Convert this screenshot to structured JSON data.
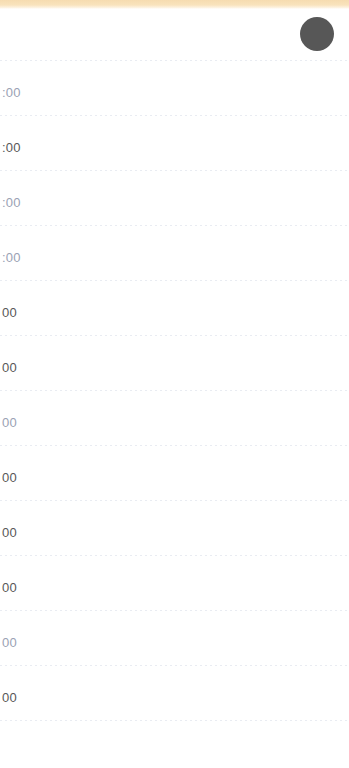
{
  "window": {
    "width": 349,
    "height": 768
  },
  "theme": {
    "accent_bar_color": "#f6dcb0",
    "avatar_color": "#575757",
    "grid_line_color": "#e9ecf2",
    "label_color": "#585858",
    "faded_label_color": "#9aa2b4",
    "background_color": "#ffffff"
  },
  "header": {
    "accent_bar": "",
    "avatar_label": ""
  },
  "schedule": {
    "rows": [
      {
        "label": "",
        "faded": false,
        "top": 6,
        "line_y": 61
      },
      {
        "label": ":00",
        "faded": true,
        "top": 61,
        "line_y": 116
      },
      {
        "label": ":00",
        "faded": false,
        "top": 116,
        "line_y": 171
      },
      {
        "label": ":00",
        "faded": true,
        "top": 171,
        "line_y": 226
      },
      {
        "label": ":00",
        "faded": true,
        "top": 226,
        "line_y": 281
      },
      {
        "label": "00",
        "faded": false,
        "top": 281,
        "line_y": 336
      },
      {
        "label": "00",
        "faded": false,
        "top": 336,
        "line_y": 391
      },
      {
        "label": "00",
        "faded": true,
        "top": 391,
        "line_y": 446
      },
      {
        "label": "00",
        "faded": false,
        "top": 446,
        "line_y": 501
      },
      {
        "label": "00",
        "faded": false,
        "top": 501,
        "line_y": 556
      },
      {
        "label": "00",
        "faded": false,
        "top": 556,
        "line_y": 611
      },
      {
        "label": "00",
        "faded": true,
        "top": 611,
        "line_y": 666
      },
      {
        "label": "00",
        "faded": false,
        "top": 666,
        "line_y": 721
      }
    ]
  }
}
